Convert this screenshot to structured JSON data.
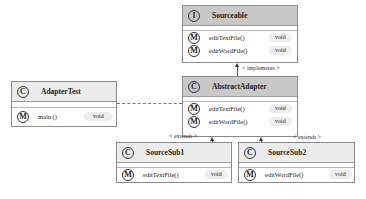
{
  "diagram": {
    "type": "UML class diagram",
    "classes": [
      {
        "id": "sourceable",
        "kind": "interface",
        "icon": "I",
        "name": "Sourceable",
        "methods": [
          {
            "name": "editTextFile()",
            "type": "void"
          },
          {
            "name": "editWordFile()",
            "type": "void"
          }
        ]
      },
      {
        "id": "abstract-adapter",
        "kind": "abstract-class",
        "icon": "C",
        "name": "AbstractAdapter",
        "methods": [
          {
            "name": "editTextFile()",
            "type": "void"
          },
          {
            "name": "editWordFile()",
            "type": "void"
          }
        ]
      },
      {
        "id": "adapter-test",
        "kind": "class",
        "icon": "C",
        "name": "AdapterTest",
        "methods": [
          {
            "name": "main ()",
            "type": "void"
          }
        ]
      },
      {
        "id": "source-sub1",
        "kind": "class",
        "icon": "C",
        "name": "SourceSub1",
        "methods": [
          {
            "name": "editTextFile()",
            "type": "void"
          }
        ]
      },
      {
        "id": "source-sub2",
        "kind": "class",
        "icon": "C",
        "name": "SourceSub2",
        "methods": [
          {
            "name": "editWordFile()",
            "type": "void"
          }
        ]
      }
    ],
    "relations": [
      {
        "from": "AbstractAdapter",
        "to": "Sourceable",
        "label": "< implements >"
      },
      {
        "from": "SourceSub1",
        "to": "AbstractAdapter",
        "label": "< extends >"
      },
      {
        "from": "SourceSub2",
        "to": "AbstractAdapter",
        "label": "< extends >"
      },
      {
        "from": "AdapterTest",
        "to": "AbstractAdapter",
        "label": "",
        "style": "dashed"
      }
    ],
    "method_icon": "M"
  }
}
